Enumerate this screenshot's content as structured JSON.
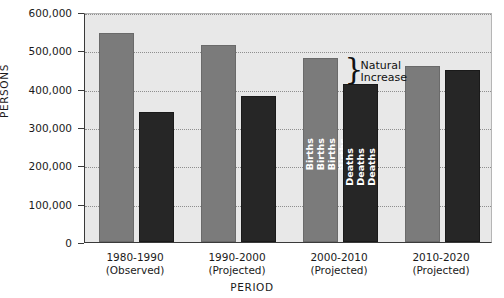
{
  "chart_data": {
    "type": "bar",
    "title": "",
    "xlabel": "PERIOD",
    "ylabel": "PERSONS",
    "ylim": [
      0,
      600000
    ],
    "ytick_values": [
      0,
      100000,
      200000,
      300000,
      400000,
      500000,
      600000
    ],
    "ytick_labels": [
      "0",
      "100,000",
      "200,000",
      "300,000",
      "400,000",
      "500,000",
      "600,000"
    ],
    "grid": true,
    "legend": "none",
    "categories": [
      "1980-1990\n(Observed)",
      "1990-2000\n(Projected)",
      "2000-2010\n(Projected)",
      "2010-2020\n(Projected)"
    ],
    "category_lines": [
      {
        "period": "1980-1990",
        "status": "(Observed)"
      },
      {
        "period": "1990-2000",
        "status": "(Projected)"
      },
      {
        "period": "2000-2010",
        "status": "(Projected)"
      },
      {
        "period": "2010-2020",
        "status": "(Projected)"
      }
    ],
    "series": [
      {
        "name": "Births",
        "color": "#7b7b7b",
        "values": [
          545000,
          513000,
          480000,
          460000
        ]
      },
      {
        "name": "Deaths",
        "color": "#262626",
        "values": [
          340000,
          380000,
          413000,
          450000
        ]
      }
    ],
    "annotations": [
      {
        "name": "natural-increase",
        "line1": "Natural",
        "line2": "Increase",
        "brace": "}",
        "applies_to_category": "2000-2010 (Projected)",
        "from_value": 413000,
        "to_value": 480000
      }
    ],
    "in_bar_labels": {
      "births_bar_label": "Births",
      "births_label_repeat": 5,
      "deaths_bar_label": "Deaths",
      "deaths_label_repeat": 3,
      "labeled_category": "2000-2010 (Projected)"
    }
  },
  "colors": {
    "plot_background": "#e8e8e8",
    "page_background": "#ffffff",
    "axis": "#3a3a3a",
    "gridline": "#8e8e8e",
    "births": "#7b7b7b",
    "deaths": "#262626",
    "text": "#1a1a1a"
  }
}
